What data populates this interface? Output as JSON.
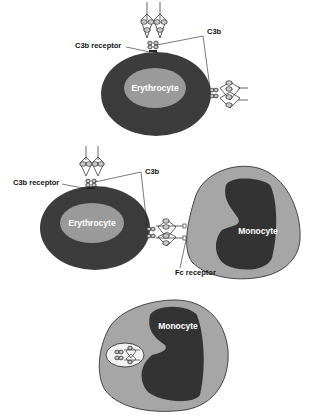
{
  "diagram": {
    "colors": {
      "erythrocyte_outer": "#3c3c3c",
      "erythrocyte_inner": "#9a9a9a",
      "monocyte_cytoplasm": "#a6a6a6",
      "monocyte_nucleus": "#333333",
      "phagosome": "#f2f2f2",
      "line": "#222222"
    },
    "panel1": {
      "cell_label": "Erythrocyte",
      "receptor_label": "C3b receptor",
      "c3b_label": "C3b"
    },
    "panel2": {
      "erythrocyte_label": "Erythrocyte",
      "monocyte_label": "Monocyte",
      "receptor_label": "C3b receptor",
      "c3b_label": "C3b",
      "fc_label": "Fc receptor"
    },
    "panel3": {
      "monocyte_label": "Monocyte"
    }
  }
}
